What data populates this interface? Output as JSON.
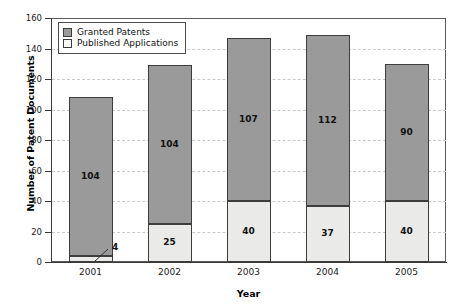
{
  "chart_data": {
    "type": "bar",
    "stacked": true,
    "title": "",
    "xlabel": "Year",
    "ylabel": "Number of Patent Documents",
    "categories": [
      "2001",
      "2002",
      "2003",
      "2004",
      "2005"
    ],
    "series": [
      {
        "name": "Granted Patents",
        "color": "#9a9a9a",
        "values": [
          104,
          104,
          107,
          112,
          90
        ]
      },
      {
        "name": "Published Applications",
        "color": "#eaeae8",
        "values": [
          4,
          25,
          40,
          37,
          40
        ]
      }
    ],
    "totals": [
      108,
      129,
      147,
      149,
      130
    ],
    "ylim": [
      0,
      160
    ],
    "ytick_step": 20,
    "yticks": [
      "160",
      "140",
      "120",
      "100",
      "80",
      "60",
      "40",
      "20",
      "0"
    ],
    "ytick_values": [
      160,
      140,
      120,
      100,
      80,
      60,
      40,
      20,
      0
    ],
    "grid": true,
    "grid_style": "dashed",
    "grid_color": "#c9c9c9",
    "legend_position": "top-left-inside",
    "annotations": [
      {
        "text": "4",
        "for_category": "2001",
        "for_series": "Published Applications",
        "style": "leader-line-outside"
      }
    ],
    "bar_labels": {
      "2001": {
        "granted": "104",
        "published": "4"
      },
      "2002": {
        "granted": "104",
        "published": "25"
      },
      "2003": {
        "granted": "107",
        "published": "40"
      },
      "2004": {
        "granted": "112",
        "published": "37"
      },
      "2005": {
        "granted": "90",
        "published": "40"
      }
    }
  }
}
